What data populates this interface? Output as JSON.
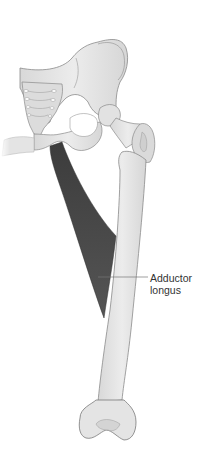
{
  "figure": {
    "labels": [
      {
        "line1": "Adductor",
        "line2": "longus"
      }
    ],
    "colors": {
      "bone_fill": "#e6e6e6",
      "bone_stroke": "#8a8a8a",
      "muscle_fill": "#4e4e4e",
      "leader_line": "#777777",
      "label_text": "#333333",
      "background": "#ffffff"
    }
  }
}
